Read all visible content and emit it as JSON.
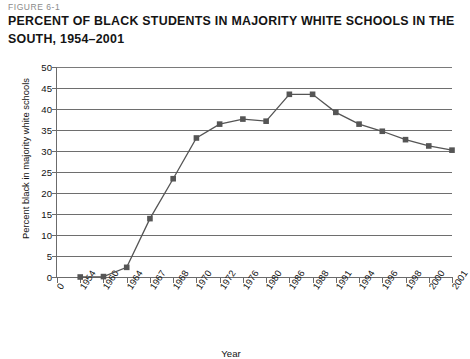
{
  "figure": {
    "number_label": "FIGURE 6-1",
    "title": "PERCENT OF BLACK STUDENTS IN MAJORITY WHITE SCHOOLS IN THE SOUTH, 1954–2001"
  },
  "chart_data": {
    "type": "line",
    "title": "PERCENT OF BLACK STUDENTS IN MAJORITY WHITE SCHOOLS IN THE SOUTH, 1954–2001",
    "xlabel": "Year",
    "ylabel": "Percent black in majority white schools",
    "categories": [
      "0",
      "1954",
      "1960",
      "1964",
      "1967",
      "1968",
      "1970",
      "1972",
      "1976",
      "1980",
      "1986",
      "1988",
      "1991",
      "1994",
      "1996",
      "1998",
      "2000",
      "2001"
    ],
    "values": [
      null,
      0.0,
      0.1,
      2.3,
      13.9,
      23.4,
      33.1,
      36.4,
      37.6,
      37.1,
      43.5,
      43.5,
      39.2,
      36.4,
      34.7,
      32.7,
      31.2,
      30.2
    ],
    "ylim": [
      0,
      50
    ],
    "ytick_labels": [
      "0",
      "5",
      "10",
      "15",
      "20",
      "25",
      "30",
      "35",
      "40",
      "45",
      "50"
    ],
    "ytick_values": [
      0,
      5,
      10,
      15,
      20,
      25,
      30,
      35,
      40,
      45,
      50
    ],
    "grid": true,
    "legend": null,
    "marker": "square",
    "series_color": "#555555",
    "grid_color": "#6e6e6e",
    "axis_color": "#6b6b6b"
  }
}
